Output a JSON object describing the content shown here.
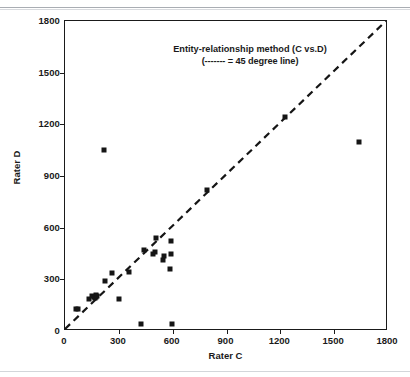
{
  "chart_data": {
    "type": "scatter",
    "title": "Entity-relationship method (C vs.D)",
    "subtitle": "(------- = 45 degree line)",
    "xlabel": "Rater C",
    "ylabel": "Rater D",
    "xlim": [
      0,
      1800
    ],
    "ylim": [
      0,
      1800
    ],
    "xticks": [
      0,
      300,
      600,
      900,
      1200,
      1500,
      1800
    ],
    "yticks": [
      0,
      300,
      600,
      900,
      1200,
      1500,
      1800
    ],
    "grid": false,
    "legend": "none",
    "marker": "filled-square",
    "marker_color": "#151515",
    "reference_line": {
      "name": "45 degree line",
      "style": "dashed",
      "color": "#151515",
      "from": [
        0,
        0
      ],
      "to": [
        1800,
        1800
      ]
    },
    "points": [
      {
        "x": 60,
        "y": 125
      },
      {
        "x": 75,
        "y": 130
      },
      {
        "x": 135,
        "y": 185
      },
      {
        "x": 150,
        "y": 205
      },
      {
        "x": 160,
        "y": 200
      },
      {
        "x": 165,
        "y": 190
      },
      {
        "x": 170,
        "y": 210
      },
      {
        "x": 175,
        "y": 195
      },
      {
        "x": 180,
        "y": 205
      },
      {
        "x": 215,
        "y": 1050
      },
      {
        "x": 225,
        "y": 290
      },
      {
        "x": 260,
        "y": 335
      },
      {
        "x": 300,
        "y": 185
      },
      {
        "x": 355,
        "y": 345
      },
      {
        "x": 425,
        "y": 40
      },
      {
        "x": 440,
        "y": 470
      },
      {
        "x": 490,
        "y": 450
      },
      {
        "x": 500,
        "y": 460
      },
      {
        "x": 505,
        "y": 540
      },
      {
        "x": 545,
        "y": 415
      },
      {
        "x": 550,
        "y": 435
      },
      {
        "x": 585,
        "y": 360
      },
      {
        "x": 590,
        "y": 450
      },
      {
        "x": 590,
        "y": 520
      },
      {
        "x": 595,
        "y": 40
      },
      {
        "x": 790,
        "y": 820
      },
      {
        "x": 1225,
        "y": 1245
      },
      {
        "x": 1640,
        "y": 1100
      }
    ]
  }
}
